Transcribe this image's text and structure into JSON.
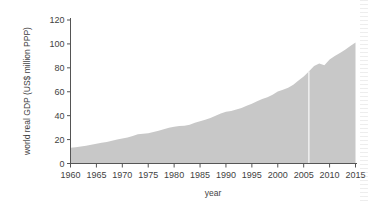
{
  "chart_data": {
    "type": "area",
    "title": "",
    "xlabel": "year",
    "ylabel": "world real GDP (US$ million PPP)",
    "xlim": [
      1960,
      2015
    ],
    "ylim": [
      0,
      120
    ],
    "grid": false,
    "legend": "none",
    "series_color": "#c8c8c8",
    "xticks": [
      1960,
      1965,
      1970,
      1975,
      1980,
      1985,
      1990,
      1995,
      2000,
      2005,
      2010,
      2015
    ],
    "yticks": [
      0,
      20,
      40,
      60,
      80,
      100,
      120
    ],
    "x": [
      1960,
      1961,
      1962,
      1963,
      1964,
      1965,
      1966,
      1967,
      1968,
      1969,
      1970,
      1971,
      1972,
      1973,
      1974,
      1975,
      1976,
      1977,
      1978,
      1979,
      1980,
      1981,
      1982,
      1983,
      1984,
      1985,
      1986,
      1987,
      1988,
      1989,
      1990,
      1991,
      1992,
      1993,
      1994,
      1995,
      1996,
      1997,
      1998,
      1999,
      2000,
      2001,
      2002,
      2003,
      2004,
      2005,
      2006,
      2007,
      2008,
      2009,
      2010,
      2011,
      2012,
      2013,
      2014,
      2015
    ],
    "values": [
      13.2,
      13.6,
      14.2,
      14.8,
      15.7,
      16.5,
      17.4,
      18.0,
      19.0,
      20.1,
      21.0,
      21.8,
      22.9,
      24.4,
      24.9,
      25.2,
      26.4,
      27.4,
      28.6,
      30.0,
      30.8,
      31.4,
      31.6,
      32.4,
      34.1,
      35.3,
      36.6,
      38.1,
      40.0,
      41.8,
      43.3,
      44.0,
      45.1,
      46.4,
      48.3,
      50.0,
      52.0,
      54.0,
      55.4,
      57.5,
      60.3,
      61.6,
      63.3,
      65.8,
      69.4,
      72.8,
      77.0,
      81.6,
      83.6,
      82.2,
      87.0,
      90.0,
      92.5,
      95.2,
      98.2,
      101.2
    ],
    "annotations": {
      "scan_artifact_vertical_line_year": 2006,
      "dip_years": [
        2008,
        2009
      ]
    }
  },
  "axis": {
    "y_title": "world real GDP (US$ million PPP)",
    "x_title": "year",
    "y_tick_labels": [
      "0",
      "20",
      "40",
      "60",
      "80",
      "100",
      "120"
    ],
    "x_tick_labels": [
      "1960",
      "1965",
      "1970",
      "1975",
      "1980",
      "1985",
      "1990",
      "1995",
      "2000",
      "2005",
      "2010",
      "2015"
    ]
  },
  "colors": {
    "area_fill": "#c8c8c8",
    "axis_line": "#555555",
    "text": "#3f3f3f",
    "background": "#ffffff"
  }
}
